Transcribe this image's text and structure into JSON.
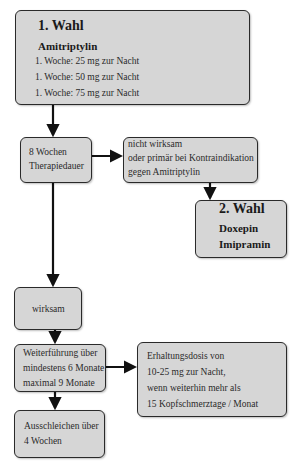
{
  "diagram": {
    "first_choice": {
      "title": "1. Wahl",
      "drug": "Amitriptylin",
      "dosing": [
        "1. Woche: 25 mg zur Nacht",
        "1. Woche: 50 mg zur Nacht",
        "1. Woche: 75 mg zur Nacht"
      ]
    },
    "therapy_duration": {
      "lines": [
        "8 Wochen",
        "Therapiedauer"
      ]
    },
    "not_effective": {
      "lines": [
        "nicht wirksam",
        "oder primär bei Kontraindikation",
        "gegen Amitriptylin"
      ]
    },
    "second_choice": {
      "title": "2. Wahl",
      "drugs": [
        "Doxepin",
        "Imipramin"
      ]
    },
    "effective": {
      "label": "wirksam"
    },
    "continuation": {
      "lines": [
        "Weiterführung über",
        "mindestens 6 Monate",
        "maximal 9 Monate"
      ]
    },
    "maintenance": {
      "lines": [
        "Erhaltungsdosis von",
        "10-25 mg zur Nacht,",
        "wenn weiterhin mehr als",
        "15 Kopfschmerztage / Monat"
      ]
    },
    "taper": {
      "lines": [
        "Ausschleichen über",
        "4 Wochen"
      ]
    },
    "colors": {
      "box_fill": "#d6d6d6",
      "box_border": "#2a2a2a",
      "arrow": "#111111"
    }
  }
}
